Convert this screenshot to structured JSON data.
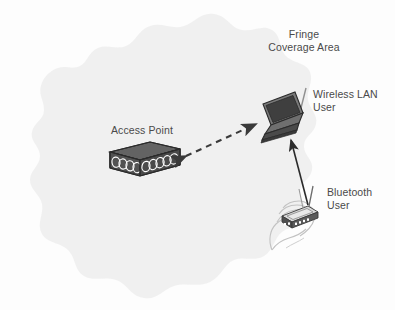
{
  "figure": {
    "background_color": "#ffffff",
    "coverage_fill": "#efefef",
    "device_dark": "#4e4e4e",
    "device_darker": "#3a3a3a",
    "device_mid": "#6b6b6b",
    "outline": "#2b2b2b",
    "text_color": "#4a4a4a",
    "hand_stroke": "#b8b8b8"
  },
  "labels": {
    "fringe": {
      "line1": "Fringe",
      "line2": "Coverage Area"
    },
    "wireless_lan": {
      "line1": "Wireless LAN",
      "line2": "User"
    },
    "bluetooth": {
      "line1": "Bluetooth",
      "line2": "User"
    },
    "access_point": {
      "line1": "Access Point"
    }
  },
  "nodes": {
    "access_point": {
      "name": "Access Point",
      "icon": "access-point-box-icon",
      "x": 108,
      "y": 143,
      "width": 72,
      "height": 36
    },
    "wireless_lan_user": {
      "name": "Wireless LAN User",
      "icon": "laptop-icon",
      "x": 256,
      "y": 90,
      "width": 48,
      "height": 50
    },
    "bluetooth_user": {
      "name": "Bluetooth User",
      "icon": "handheld-pda-in-hand-icon",
      "x": 268,
      "y": 188,
      "width": 60,
      "height": 62
    }
  },
  "links": [
    {
      "name": "access-point-to-wireless-lan-link",
      "style": "dashed",
      "arrowheads": "both",
      "from": "access_point",
      "to": "wireless_lan_user"
    },
    {
      "name": "bluetooth-to-wireless-lan-link",
      "style": "solid",
      "arrowheads": "end",
      "from": "bluetooth_user",
      "to": "wireless_lan_user"
    }
  ],
  "coverage_area": {
    "name": "Fringe Coverage Area",
    "shape": "irregular-blob"
  }
}
